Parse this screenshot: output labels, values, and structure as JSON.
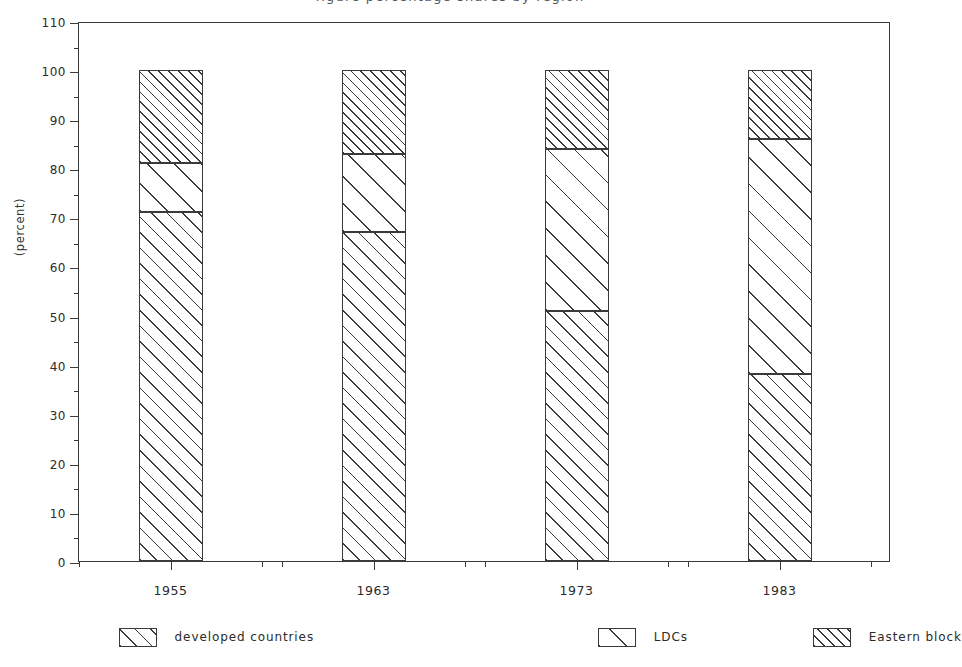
{
  "title_sliver": "figure percentage shares by region",
  "axes": {
    "ylabel": "(percent)",
    "yticks": [
      "0",
      "10",
      "20",
      "30",
      "40",
      "50",
      "60",
      "70",
      "80",
      "90",
      "100",
      "110"
    ],
    "xticks": [
      "1955",
      "1963",
      "1973",
      "1983"
    ]
  },
  "legend": {
    "items": [
      {
        "label": "developed countries",
        "pattern": "h-dev"
      },
      {
        "label": "LDCs",
        "pattern": "h-ldc"
      },
      {
        "label": "Eastern block",
        "pattern": "h-east"
      }
    ]
  },
  "chart_data": {
    "type": "bar",
    "subtype": "stacked",
    "title": "",
    "xlabel": "",
    "ylabel": "(percent)",
    "ylim": [
      0,
      110
    ],
    "ytick_step": 10,
    "grid": false,
    "legend_position": "bottom",
    "categories": [
      "1955",
      "1963",
      "1973",
      "1983"
    ],
    "series": [
      {
        "name": "developed countries",
        "values": [
          71,
          67,
          51,
          38
        ]
      },
      {
        "name": "LDCs",
        "values": [
          10,
          16,
          33,
          48
        ]
      },
      {
        "name": "Eastern block",
        "values": [
          19,
          17,
          16,
          14
        ]
      }
    ],
    "cumulative_boundaries": [
      [
        71,
        81,
        100
      ],
      [
        67,
        83,
        100
      ],
      [
        51,
        84,
        100
      ],
      [
        38,
        86,
        100
      ]
    ],
    "bar_total": 100
  },
  "colors": {
    "ink": "#3a3a3a",
    "background": "#ffffff"
  }
}
